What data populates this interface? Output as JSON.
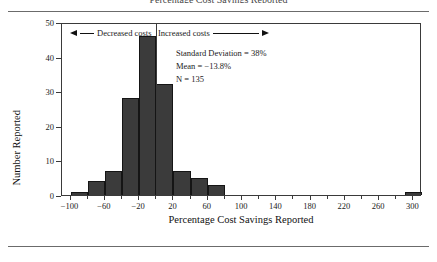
{
  "figure": {
    "title_partial": "Percentage Cost Savings Reported",
    "ylabel": "Number Reported",
    "xlabel": "Percentage Cost Savings Reported"
  },
  "annotations": {
    "decreased": "Decreased costs",
    "increased": "Increased costs"
  },
  "stats": {
    "sd": "Standard Deviation = 38%",
    "mean": "Mean = −13.8%",
    "n": "N = 135"
  },
  "colors": {
    "bar_fill": "#3b3b3b",
    "bar_edge": "#151515",
    "axis": "#3a3a3a",
    "rule": "#6b6b6b",
    "text": "#1a1a1a"
  },
  "chart_data": {
    "type": "bar",
    "title": "",
    "xlabel": "Percentage Cost Savings Reported",
    "ylabel": "Number Reported",
    "xlim": [
      -110,
      310
    ],
    "ylim": [
      0,
      50
    ],
    "grid": false,
    "legend": null,
    "bin_width": 20,
    "xticks": [
      -100,
      -60,
      -20,
      20,
      60,
      100,
      140,
      180,
      220,
      260,
      300
    ],
    "xticks_minor": [
      -80,
      -40,
      0,
      40,
      80,
      120,
      160,
      200,
      240,
      280
    ],
    "yticks": [
      0,
      10,
      20,
      30,
      40,
      50
    ],
    "bin_starts": [
      -100,
      -80,
      -60,
      -40,
      -20,
      0,
      20,
      40,
      60,
      290
    ],
    "categories": [
      "-100 to -80",
      "-80 to -60",
      "-60 to -40",
      "-40 to -20",
      "-20 to 0",
      "0 to 20",
      "20 to 40",
      "40 to 60",
      "60 to 80",
      "290 to 310"
    ],
    "values": [
      1,
      4,
      7,
      28,
      46,
      32,
      7,
      5,
      3,
      1
    ],
    "annotations": [
      {
        "text": "Decreased costs",
        "direction": "left"
      },
      {
        "text": "Increased costs",
        "direction": "right"
      },
      {
        "text": "Standard Deviation = 38%"
      },
      {
        "text": "Mean = −13.8%"
      },
      {
        "text": "N = 135"
      }
    ],
    "summary": {
      "standard_deviation_pct": 38,
      "mean_pct": -13.8,
      "n": 135
    }
  }
}
